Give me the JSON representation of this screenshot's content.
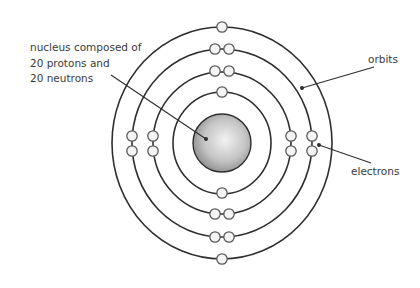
{
  "diagram": {
    "nucleus_label": [
      "nucleus composed of",
      "20 protons and",
      "20 neutrons"
    ],
    "orbits_label": "orbits",
    "electrons_label": "electrons",
    "colors": {
      "line": "#2e2e2e",
      "electron_fill": "#f4f4f4",
      "electron_stroke": "#5a5a5a",
      "nucleus_light": "#e6e6e6",
      "nucleus_dark": "#8a8a8a"
    },
    "nucleus": {
      "cx": 222,
      "cy": 143,
      "r": 29
    },
    "orbits": [
      {
        "name": "orbit-1",
        "rx": 110,
        "ry": 116,
        "electrons": 2
      },
      {
        "name": "orbit-2",
        "rx": 90,
        "ry": 94,
        "electrons": 8
      },
      {
        "name": "orbit-3",
        "rx": 69,
        "ry": 71,
        "electrons": 8
      },
      {
        "name": "orbit-4",
        "rx": 49,
        "ry": 51,
        "electrons": 2
      }
    ],
    "electron_total": 20
  }
}
